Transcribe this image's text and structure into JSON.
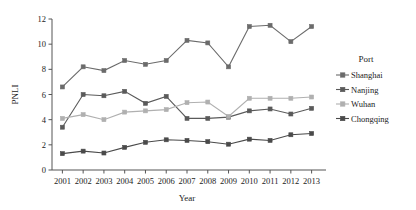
{
  "chart_data": {
    "type": "line",
    "title": "",
    "xlabel": "Year",
    "ylabel": "PNLI",
    "categories": [
      "2001",
      "2002",
      "2003",
      "2004",
      "2005",
      "2006",
      "2007",
      "2008",
      "2009",
      "2010",
      "2011",
      "2012",
      "2013"
    ],
    "x": [
      2001,
      2002,
      2003,
      2004,
      2005,
      2006,
      2007,
      2008,
      2009,
      2010,
      2011,
      2012,
      2013
    ],
    "xlim": [
      2000.5,
      2013.5
    ],
    "ylim": [
      0,
      12
    ],
    "yticks": [
      0,
      2,
      4,
      6,
      8,
      10,
      12
    ],
    "grid": false,
    "legend_position": "right",
    "legend_title": "Port",
    "series": [
      {
        "name": "Shanghai",
        "color": "#6b6b6b",
        "marker": "square",
        "values": [
          6.6,
          8.2,
          7.9,
          8.7,
          8.4,
          8.7,
          10.3,
          10.1,
          8.2,
          11.4,
          11.5,
          10.2,
          11.4
        ]
      },
      {
        "name": "Nanjing",
        "color": "#5a5a5a",
        "marker": "square",
        "values": [
          3.4,
          6.0,
          5.9,
          6.25,
          5.3,
          5.85,
          4.1,
          4.1,
          4.2,
          4.7,
          4.85,
          4.45,
          4.9
        ]
      },
      {
        "name": "Wuhan",
        "color": "#b0b0b0",
        "marker": "square",
        "values": [
          4.1,
          4.4,
          4.0,
          4.6,
          4.7,
          4.8,
          5.35,
          5.4,
          4.25,
          5.7,
          5.7,
          5.7,
          5.8
        ]
      },
      {
        "name": "Chongqing",
        "color": "#4a4a4a",
        "marker": "square",
        "values": [
          1.3,
          1.5,
          1.35,
          1.8,
          2.2,
          2.4,
          2.35,
          2.25,
          2.05,
          2.45,
          2.35,
          2.8,
          2.9
        ]
      }
    ]
  },
  "axes": {
    "y_tick_labels": [
      "0",
      "2",
      "4",
      "6",
      "8",
      "10",
      "12"
    ],
    "x_tick_labels": [
      "2001",
      "2002",
      "2003",
      "2004",
      "2005",
      "2006",
      "2007",
      "2008",
      "2009",
      "2010",
      "2011",
      "2012",
      "2013"
    ],
    "y_axis_title": "PNLI",
    "x_axis_title": "Year"
  },
  "legend": {
    "title": "Port",
    "items": [
      {
        "label": "Shanghai",
        "color": "#6b6b6b"
      },
      {
        "label": "Nanjing",
        "color": "#5a5a5a"
      },
      {
        "label": "Wuhan",
        "color": "#b0b0b0"
      },
      {
        "label": "Chongqing",
        "color": "#4a4a4a"
      }
    ]
  }
}
